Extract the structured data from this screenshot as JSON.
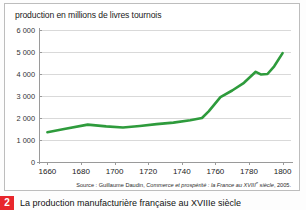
{
  "figure": {
    "title": "production en millions de livres tournois",
    "source_prefix": "Source : Guillaume Daudin, ",
    "source_italic": "Commerce et prospérité : la France au XVIII",
    "source_sup": "e",
    "source_italic_end": " siècle",
    "source_suffix": ", 2005.",
    "accent_color": "#2e9b3c",
    "grid_color": "#d9d9d9",
    "axis_color": "#9a9a9a",
    "badge_color": "#e8262c"
  },
  "caption": {
    "number": "2",
    "text": "La production manufacturière française au XVIIIe siècle"
  },
  "chart_data": {
    "type": "line",
    "title": "production en millions de livres tournois",
    "xlabel": "",
    "ylabel": "production en millions de livres tournois",
    "xlim": [
      1655,
      1805
    ],
    "ylim": [
      0,
      6000
    ],
    "xticks": [
      1660,
      1680,
      1700,
      1720,
      1740,
      1760,
      1780,
      1800
    ],
    "yticks": [
      0,
      1000,
      2000,
      3000,
      4000,
      5000,
      6000
    ],
    "ytick_labels": [
      "0",
      "1 000",
      "2 000",
      "3 000",
      "4 000",
      "5 000",
      "6 000"
    ],
    "grid": true,
    "legend": false,
    "series": [
      {
        "name": "production en millions de livres tournois",
        "color": "#2e9b3c",
        "x": [
          1660,
          1670,
          1684,
          1695,
          1705,
          1715,
          1725,
          1735,
          1745,
          1752,
          1756,
          1763,
          1770,
          1777,
          1784,
          1787,
          1791,
          1795,
          1800
        ],
        "values": [
          1350,
          1500,
          1700,
          1620,
          1570,
          1640,
          1720,
          1790,
          1900,
          2000,
          2300,
          2950,
          3250,
          3600,
          4100,
          3980,
          4000,
          4350,
          4950
        ]
      }
    ]
  }
}
